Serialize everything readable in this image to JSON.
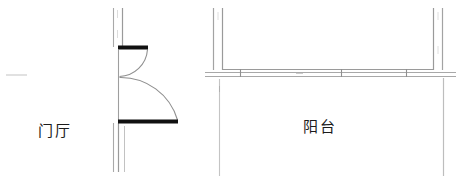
{
  "drawing": {
    "type": "architectural-floor-plan",
    "title": "",
    "background_color": "#ffffff",
    "width": 457,
    "height": 176
  },
  "labels": {
    "foyer": {
      "text": "门厅",
      "meaning": "entrance hall",
      "x": 38,
      "y": 130,
      "color": "#1b1b1b",
      "font_size": 15
    },
    "balcony": {
      "text": "阳台",
      "meaning": "balcony",
      "x": 303,
      "y": 126,
      "color": "#1b1b1b",
      "font_size": 15
    }
  },
  "colors": {
    "wall_line": "#8c8c8c",
    "wall_line_light": "#b8b8b8",
    "door_leaf": "#111111",
    "arc": "#8a8a8a",
    "faint": "#cfcfcf"
  },
  "elements": {
    "door": {
      "name": "double-leaf-swing-door",
      "jamb_x": 118,
      "top_leaf": {
        "x1": 118,
        "y1": 47.5,
        "x2": 148,
        "y2": 47.5,
        "thickness": 4
      },
      "bottom_leaf": {
        "x1": 118,
        "y1": 121.5,
        "x2": 178,
        "y2": 121.5,
        "thickness": 4
      },
      "small_arc": {
        "from_x": 148,
        "from_y": 49,
        "to_x": 119,
        "to_y": 76,
        "radius": 29
      },
      "large_arc": {
        "from_x": 178,
        "from_y": 120,
        "to_x": 119,
        "to_y": 78,
        "radius": 59
      }
    },
    "foyer_walls": {
      "upper_wall": {
        "x_outer": 113,
        "x_inner": 122,
        "y_top": 8,
        "y_bottom": 47
      },
      "lower_wall": {
        "x_outer": 113,
        "x_inner": 122,
        "y_top": 122,
        "y_bottom": 172
      },
      "jamb_line": {
        "x": 118,
        "y_top": 50,
        "y_bottom": 120
      }
    },
    "balcony": {
      "left_wall": {
        "x_outer": 213,
        "x_inner": 222,
        "y_top": 8,
        "y_bottom": 72
      },
      "right_wall": {
        "x_outer": 433,
        "x_inner": 442,
        "y_top": 8,
        "y_bottom": 72
      },
      "railing_top_y": 69,
      "railing_bottom_y": 76,
      "railing_x1": 205,
      "railing_x2": 455,
      "inner_rail_x1": 222,
      "inner_rail_x2": 433,
      "panel_dividers": [
        240,
        341,
        406
      ],
      "drop_line_left_x": 219,
      "drop_line_right_x": 443,
      "drop_line_y_top": 78,
      "drop_line_y_bottom": 176
    },
    "left_tick": {
      "x1": 6,
      "y1": 75,
      "x2": 27,
      "y2": 75
    }
  },
  "icons": {
    "door_swing": "door-swing-arc",
    "wall": "wall-section",
    "railing": "balcony-railing"
  }
}
